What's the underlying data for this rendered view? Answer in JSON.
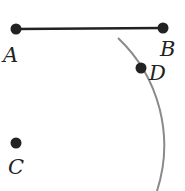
{
  "diagram": {
    "type": "geometry-construction",
    "colors": {
      "segment": "#222222",
      "point": "#222222",
      "arc": "#8a8a8a",
      "label": "#222222",
      "background": "#ffffff"
    },
    "points": [
      {
        "id": "A",
        "label": "A",
        "x": 16,
        "y": 29,
        "label_x": 3,
        "label_y": 62
      },
      {
        "id": "B",
        "label": "B",
        "x": 163,
        "y": 28,
        "label_x": 160,
        "label_y": 56
      },
      {
        "id": "D",
        "label": "D",
        "x": 141,
        "y": 68,
        "label_x": 149,
        "label_y": 80
      },
      {
        "id": "C",
        "label": "C",
        "x": 16,
        "y": 143,
        "label_x": 8,
        "label_y": 174
      }
    ],
    "segments": [
      {
        "from": "A",
        "to": "B"
      }
    ],
    "arcs": [
      {
        "center": "C",
        "cx": 16,
        "cy": 143,
        "r": 148,
        "start": [
          118,
          38
        ],
        "end": [
          157,
          191
        ],
        "passes_through": "D"
      }
    ]
  }
}
